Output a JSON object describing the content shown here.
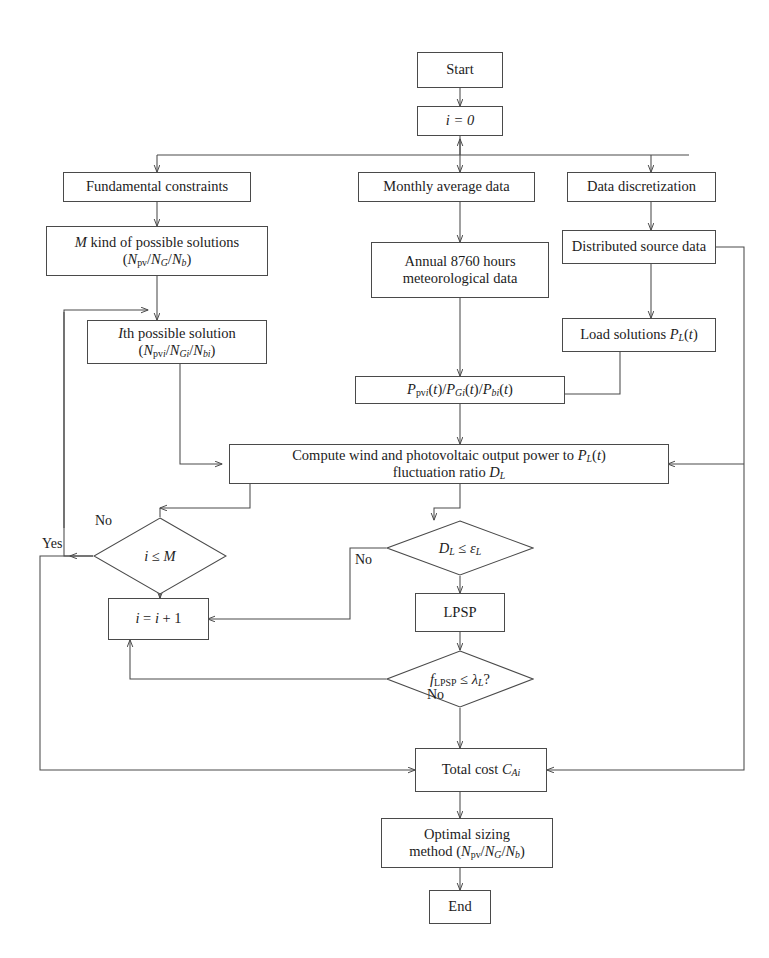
{
  "diagram": {
    "type": "flowchart",
    "background_color": "#ffffff",
    "line_color": "#4a4a4a",
    "text_color": "#1c1c1c"
  },
  "nodes": {
    "start": {
      "label": "Start",
      "shape": "box"
    },
    "init": {
      "label": "i = 0",
      "shape": "box"
    },
    "fundamental_constraints": {
      "label": "Fundamental constraints",
      "shape": "box"
    },
    "monthly_average_data": {
      "label": "Monthly average data",
      "shape": "box"
    },
    "data_discretization": {
      "label": "Data discretization",
      "shape": "box"
    },
    "m_kind_solutions": {
      "line1": "M kind of possible solutions",
      "line2": "(Npv/NG/Nb)",
      "shape": "box"
    },
    "annual_hours": {
      "line1": "Annual 8760 hours",
      "line2": "meteorological data",
      "shape": "box"
    },
    "distributed_source_data": {
      "label": "Distributed source data",
      "shape": "box"
    },
    "ith_possible_solution": {
      "line1": "Ith possible solution",
      "line2": "(Npvi/NGi/Nbi)",
      "shape": "box"
    },
    "load_solutions": {
      "label": "Load solutions PL(t)",
      "shape": "box"
    },
    "power_triplet": {
      "label": "Ppvi(t)/PGi(t)/Pbi(t)",
      "shape": "box"
    },
    "compute_power": {
      "line1": "Compute wind and photovoltaic output power to PL(t)",
      "line2": "fluctuation ratio DL",
      "shape": "box"
    },
    "check_i_le_m": {
      "label": "i ≤ M",
      "shape": "diamond"
    },
    "check_dl": {
      "label": "DL ≤ εL",
      "shape": "diamond"
    },
    "lpsp": {
      "label": "LPSP",
      "shape": "box"
    },
    "increment": {
      "label": "i = i + 1",
      "shape": "box"
    },
    "check_lpsp": {
      "label": "fLPSP ≤ λL?",
      "shape": "diamond"
    },
    "total_cost": {
      "label": "Total cost CAi",
      "shape": "box"
    },
    "optimal_sizing": {
      "line1": "Optimal sizing",
      "line2": "method (Npv/NG/Nb)",
      "shape": "box"
    },
    "end": {
      "label": "End",
      "shape": "box"
    }
  },
  "edge_labels": {
    "no_left": "No",
    "yes_left": "Yes",
    "no_dl": "No",
    "no_lpsp": "No"
  },
  "edges": [
    {
      "from": "start",
      "to": "init"
    },
    {
      "from": "init",
      "to": "fundamental_constraints"
    },
    {
      "from": "init",
      "to": "monthly_average_data"
    },
    {
      "from": "init",
      "to": "data_discretization"
    },
    {
      "from": "fundamental_constraints",
      "to": "m_kind_solutions"
    },
    {
      "from": "monthly_average_data",
      "to": "annual_hours"
    },
    {
      "from": "data_discretization",
      "to": "distributed_source_data"
    },
    {
      "from": "m_kind_solutions",
      "to": "ith_possible_solution"
    },
    {
      "from": "distributed_source_data",
      "to": "load_solutions"
    },
    {
      "from": "annual_hours",
      "to": "power_triplet"
    },
    {
      "from": "load_solutions",
      "to": "power_triplet"
    },
    {
      "from": "power_triplet",
      "to": "compute_power"
    },
    {
      "from": "ith_possible_solution",
      "to": "compute_power"
    },
    {
      "from": "distributed_source_data",
      "to": "compute_power"
    },
    {
      "from": "compute_power",
      "to": "check_i_le_m"
    },
    {
      "from": "compute_power",
      "to": "check_dl"
    },
    {
      "from": "check_i_le_m",
      "to": "ith_possible_solution",
      "label": "No"
    },
    {
      "from": "check_i_le_m",
      "to": "total_cost",
      "label": "Yes"
    },
    {
      "from": "check_dl",
      "to": "lpsp"
    },
    {
      "from": "check_dl",
      "to": "increment",
      "label": "No"
    },
    {
      "from": "lpsp",
      "to": "check_lpsp"
    },
    {
      "from": "check_lpsp",
      "to": "increment",
      "label": "No"
    },
    {
      "from": "check_lpsp",
      "to": "total_cost"
    },
    {
      "from": "increment",
      "to": "check_i_le_m"
    },
    {
      "from": "total_cost",
      "to": "optimal_sizing"
    },
    {
      "from": "optimal_sizing",
      "to": "end"
    }
  ]
}
